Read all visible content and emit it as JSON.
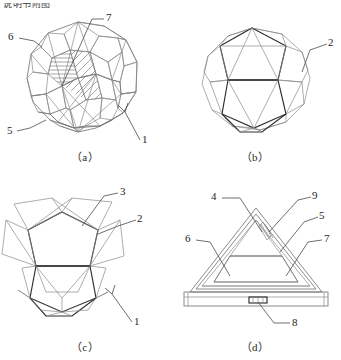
{
  "sheet": {
    "header_text": "说明书附图",
    "background_color": "#ffffff",
    "ink_color": "#2e2e2e",
    "light_ink_color": "#8a8a8a"
  },
  "panels": [
    {
      "id": "a",
      "caption": "（a）",
      "figure_name": "assembled-geodesic-sphere",
      "callouts": [
        {
          "number": "6",
          "x": 10,
          "y": 36
        },
        {
          "number": "7",
          "x": 107,
          "y": 17
        },
        {
          "number": "5",
          "x": 8,
          "y": 130
        },
        {
          "number": "1",
          "x": 143,
          "y": 139
        }
      ]
    },
    {
      "id": "b",
      "caption": "（b）",
      "figure_name": "geodesic-frame-skeleton",
      "callouts": [
        {
          "number": "2",
          "x": 160,
          "y": 42
        }
      ]
    },
    {
      "id": "c",
      "caption": "（c）",
      "figure_name": "expanded-petal-frame",
      "callouts": [
        {
          "number": "3",
          "x": 120,
          "y": 11
        },
        {
          "number": "2",
          "x": 138,
          "y": 38
        },
        {
          "number": "1",
          "x": 135,
          "y": 141
        }
      ]
    },
    {
      "id": "d",
      "caption": "（d）",
      "figure_name": "triangular-panel-unit",
      "callouts": [
        {
          "number": "4",
          "x": 44,
          "y": 16
        },
        {
          "number": "9",
          "x": 143,
          "y": 15
        },
        {
          "number": "5",
          "x": 150,
          "y": 35
        },
        {
          "number": "6",
          "x": 17,
          "y": 58
        },
        {
          "number": "7",
          "x": 157,
          "y": 58
        },
        {
          "number": "8",
          "x": 123,
          "y": 142
        }
      ]
    }
  ]
}
